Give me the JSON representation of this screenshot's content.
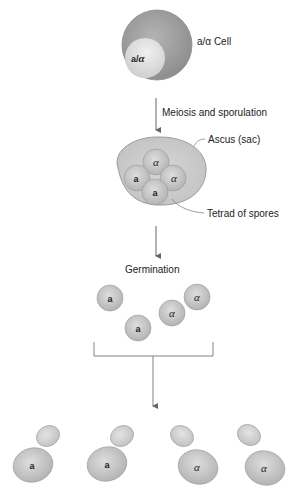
{
  "diagram": {
    "parent_cell": {
      "label": "a/α  Cell",
      "nucleus_label_a": "a/",
      "nucleus_label_alpha": "α"
    },
    "steps": [
      {
        "label": "Meiosis and sporulation"
      },
      {
        "label": "Germination"
      }
    ],
    "ascus": {
      "label": "Ascus (sac)",
      "tetrad_label": "Tetrad of spores",
      "spores": [
        "α",
        "a",
        "α",
        "a"
      ]
    },
    "germinating_spores": [
      "a",
      "a",
      "α",
      "α"
    ],
    "budding_cells": [
      "a",
      "a",
      "α",
      "α"
    ],
    "colors": {
      "cell_outer": "#9a9a9a",
      "nucleus": "#d8d8d8",
      "ascus": "#c9c9c9",
      "spore": "#b8b8b8",
      "line": "#666666"
    }
  }
}
